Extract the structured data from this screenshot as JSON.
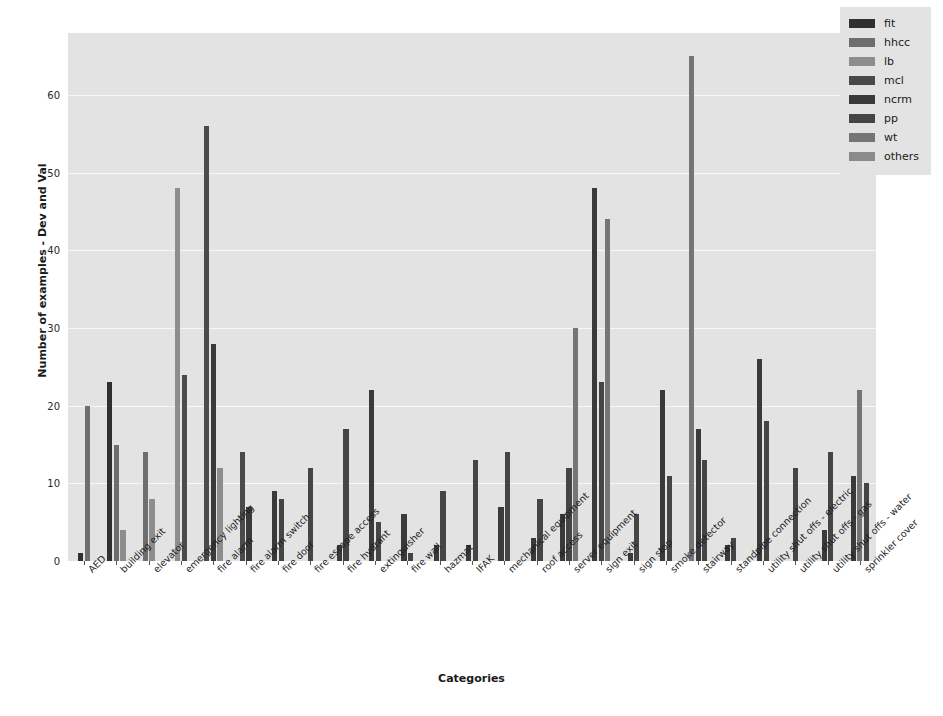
{
  "chart_data": {
    "type": "bar",
    "title": "",
    "xlabel": "Categories",
    "ylabel": "Number of examples - Dev and Val",
    "ylim": [
      0,
      68
    ],
    "yticks": [
      0,
      10,
      20,
      30,
      40,
      50,
      60
    ],
    "grid": true,
    "legend_position": "upper right",
    "categories": [
      "AED",
      "building exit",
      "elevator",
      "emergency lighting",
      "fire alarm",
      "fire alarm switch",
      "fire door",
      "fire escape access",
      "fire hydrant",
      "extinguisher",
      "fire wall",
      "hazmat",
      "IFAK",
      "mechanical equipment",
      "roof access",
      "server equipment",
      "sign exit",
      "sign stop",
      "smoke detector",
      "stairway",
      "standpipe connection",
      "utility shut offs - electric",
      "utility shut offs - gas",
      "utility shut offs - water",
      "sprinkler cover"
    ],
    "series": [
      {
        "name": "fit",
        "color": "#303030",
        "values": [
          1,
          23,
          0,
          0,
          0,
          0,
          0,
          0,
          0,
          0,
          0,
          0,
          0,
          0,
          0,
          0,
          0,
          0,
          0,
          0,
          0,
          0,
          0,
          0,
          0
        ]
      },
      {
        "name": "hhcc",
        "color": "#6e6e6e",
        "values": [
          20,
          15,
          14,
          0,
          0,
          0,
          0,
          0,
          0,
          0,
          0,
          0,
          0,
          0,
          0,
          0,
          0,
          0,
          0,
          0,
          0,
          0,
          0,
          0,
          0
        ]
      },
      {
        "name": "lb",
        "color": "#8d8d8d",
        "values": [
          0,
          4,
          8,
          48,
          12,
          0,
          0,
          0,
          0,
          0,
          0,
          0,
          0,
          0,
          0,
          0,
          0,
          0,
          0,
          0,
          0,
          0,
          0,
          0,
          0
        ]
      },
      {
        "name": "mcl",
        "color": "#4a4a4a",
        "values": [
          0,
          0,
          0,
          24,
          56,
          14,
          0,
          0,
          0,
          0,
          0,
          0,
          0,
          0,
          0,
          0,
          0,
          0,
          0,
          0,
          0,
          0,
          0,
          0,
          0
        ]
      },
      {
        "name": "ncrm",
        "color": "#3a3a3a",
        "values": [
          0,
          0,
          0,
          0,
          28,
          7,
          9,
          0,
          2,
          22,
          6,
          2,
          2,
          7,
          3,
          6,
          48,
          1,
          22,
          17,
          2,
          26,
          0,
          4,
          11
        ]
      },
      {
        "name": "pp",
        "color": "#454545",
        "values": [
          0,
          0,
          0,
          0,
          0,
          0,
          8,
          12,
          17,
          5,
          1,
          9,
          13,
          14,
          8,
          12,
          23,
          6,
          11,
          13,
          3,
          18,
          12,
          14,
          10
        ]
      },
      {
        "name": "wt",
        "color": "#757575",
        "values": [
          0,
          0,
          0,
          0,
          0,
          0,
          0,
          0,
          0,
          0,
          0,
          0,
          0,
          0,
          0,
          30,
          44,
          0,
          0,
          65,
          0,
          0,
          0,
          0,
          22
        ]
      },
      {
        "name": "others",
        "color": "#8a8a8a",
        "values": [
          0,
          0,
          0,
          0,
          0,
          0,
          0,
          0,
          0,
          0,
          0,
          0,
          0,
          0,
          0,
          0,
          0,
          0,
          0,
          0,
          0,
          0,
          0,
          0,
          0
        ]
      }
    ],
    "bars": [
      {
        "category": "AED",
        "items": [
          {
            "series": "fit",
            "value": 1
          },
          {
            "series": "hhcc",
            "value": 20
          }
        ]
      },
      {
        "category": "building exit",
        "items": [
          {
            "series": "fit",
            "value": 23
          },
          {
            "series": "hhcc",
            "value": 15
          },
          {
            "series": "lb",
            "value": 4
          }
        ]
      },
      {
        "category": "elevator",
        "items": [
          {
            "series": "hhcc",
            "value": 14
          },
          {
            "series": "lb",
            "value": 8
          }
        ]
      },
      {
        "category": "emergency lighting",
        "items": [
          {
            "series": "lb",
            "value": 48
          },
          {
            "series": "mcl",
            "value": 24
          }
        ]
      },
      {
        "category": "fire alarm",
        "items": [
          {
            "series": "mcl",
            "value": 56
          },
          {
            "series": "ncrm",
            "value": 28
          },
          {
            "series": "lb",
            "value": 12
          }
        ]
      },
      {
        "category": "fire alarm switch",
        "items": [
          {
            "series": "mcl",
            "value": 14
          },
          {
            "series": "ncrm",
            "value": 7
          }
        ]
      },
      {
        "category": "fire door",
        "items": [
          {
            "series": "ncrm",
            "value": 9
          },
          {
            "series": "pp",
            "value": 8
          }
        ]
      },
      {
        "category": "fire escape access",
        "items": [
          {
            "series": "pp",
            "value": 12
          }
        ]
      },
      {
        "category": "fire hydrant",
        "items": [
          {
            "series": "ncrm",
            "value": 2
          },
          {
            "series": "pp",
            "value": 17
          }
        ]
      },
      {
        "category": "extinguisher",
        "items": [
          {
            "series": "ncrm",
            "value": 22
          },
          {
            "series": "pp",
            "value": 5
          }
        ]
      },
      {
        "category": "fire wall",
        "items": [
          {
            "series": "ncrm",
            "value": 6
          },
          {
            "series": "pp",
            "value": 1
          }
        ]
      },
      {
        "category": "hazmat",
        "items": [
          {
            "series": "ncrm",
            "value": 2
          },
          {
            "series": "pp",
            "value": 9
          }
        ]
      },
      {
        "category": "IFAK",
        "items": [
          {
            "series": "ncrm",
            "value": 2
          },
          {
            "series": "pp",
            "value": 13
          }
        ]
      },
      {
        "category": "mechanical equipment",
        "items": [
          {
            "series": "ncrm",
            "value": 7
          },
          {
            "series": "pp",
            "value": 14
          }
        ]
      },
      {
        "category": "roof access",
        "items": [
          {
            "series": "ncrm",
            "value": 3
          },
          {
            "series": "pp",
            "value": 8
          }
        ]
      },
      {
        "category": "server equipment",
        "items": [
          {
            "series": "ncrm",
            "value": 6
          },
          {
            "series": "pp",
            "value": 12
          },
          {
            "series": "wt",
            "value": 30
          }
        ]
      },
      {
        "category": "sign exit",
        "items": [
          {
            "series": "ncrm",
            "value": 48
          },
          {
            "series": "pp",
            "value": 23
          },
          {
            "series": "wt",
            "value": 44
          }
        ]
      },
      {
        "category": "sign stop",
        "items": [
          {
            "series": "ncrm",
            "value": 1
          },
          {
            "series": "pp",
            "value": 6
          }
        ]
      },
      {
        "category": "smoke detector",
        "items": [
          {
            "series": "ncrm",
            "value": 22
          },
          {
            "series": "pp",
            "value": 11
          }
        ]
      },
      {
        "category": "stairway",
        "items": [
          {
            "series": "wt",
            "value": 65
          },
          {
            "series": "ncrm",
            "value": 17
          },
          {
            "series": "pp",
            "value": 13
          }
        ]
      },
      {
        "category": "standpipe connection",
        "items": [
          {
            "series": "ncrm",
            "value": 2
          },
          {
            "series": "pp",
            "value": 3
          }
        ]
      },
      {
        "category": "utility shut offs - electric",
        "items": [
          {
            "series": "ncrm",
            "value": 26
          },
          {
            "series": "pp",
            "value": 18
          }
        ]
      },
      {
        "category": "utility shut offs - gas",
        "items": [
          {
            "series": "pp",
            "value": 12
          }
        ]
      },
      {
        "category": "utility shut offs - water",
        "items": [
          {
            "series": "ncrm",
            "value": 4
          },
          {
            "series": "pp",
            "value": 14
          }
        ]
      },
      {
        "category": "sprinkler cover",
        "items": [
          {
            "series": "ncrm",
            "value": 11
          },
          {
            "series": "wt",
            "value": 22
          },
          {
            "series": "pp",
            "value": 10
          }
        ]
      }
    ]
  },
  "legend": {
    "entries": [
      {
        "label": "fit",
        "color": "#303030"
      },
      {
        "label": "hhcc",
        "color": "#6e6e6e"
      },
      {
        "label": "lb",
        "color": "#8d8d8d"
      },
      {
        "label": "mcl",
        "color": "#4a4a4a"
      },
      {
        "label": "ncrm",
        "color": "#3a3a3a"
      },
      {
        "label": "pp",
        "color": "#454545"
      },
      {
        "label": "wt",
        "color": "#757575"
      },
      {
        "label": "others",
        "color": "#8a8a8a"
      }
    ]
  },
  "style": {
    "plot_background": "#e3e3e3",
    "grid_color": "#f7f7f7",
    "figure_background": "#ffffff"
  }
}
